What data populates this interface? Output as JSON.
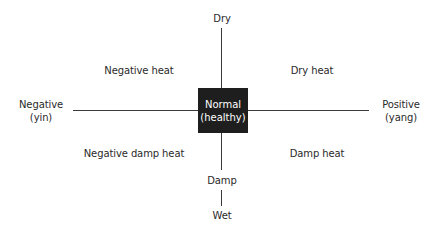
{
  "diagram": {
    "center": {
      "line1": "Normal",
      "line2": "(healthy)"
    },
    "axes": {
      "top": "Dry",
      "bottom_inner": "Damp",
      "bottom_outer": "Wet",
      "left": {
        "line1": "Negative",
        "line2": "(yin)"
      },
      "right": {
        "line1": "Positive",
        "line2": "(yang)"
      }
    },
    "quadrants": {
      "top_left": "Negative heat",
      "top_right": "Dry heat",
      "bottom_left": "Negative damp heat",
      "bottom_right": "Damp heat"
    },
    "colors": {
      "box": "#1e1e1e",
      "line": "#3a3a3a",
      "text": "#2a2a2a"
    }
  }
}
